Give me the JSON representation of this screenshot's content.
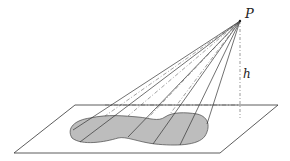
{
  "diagram": {
    "labels": {
      "apex": "P",
      "height": "h"
    },
    "colors": {
      "line": "#333333",
      "base_fill": "#bdbdbd",
      "background": "#ffffff"
    }
  }
}
